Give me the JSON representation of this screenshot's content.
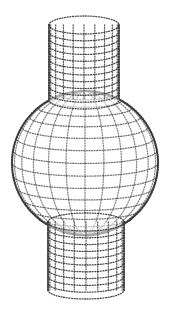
{
  "figure": {
    "background": "#ffffff",
    "dot_color": "#3a3a3a",
    "shapes": [
      {
        "name": "top-cylinder",
        "cx": 84,
        "top": 25,
        "bottom": 100,
        "rx": 35,
        "ry": 9
      },
      {
        "name": "sphere",
        "cx": 85,
        "cy": 163,
        "rx": 73,
        "ry": 72
      },
      {
        "name": "bottom-cylinder",
        "cx": 86,
        "top": 222,
        "bottom": 290,
        "rx": 38,
        "ry": 9
      }
    ]
  }
}
